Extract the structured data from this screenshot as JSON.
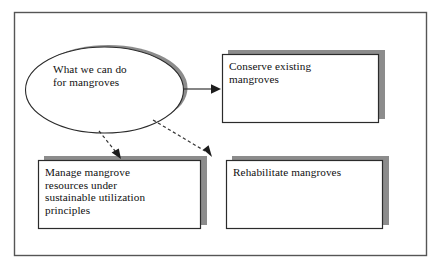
{
  "diagram": {
    "type": "flowchart",
    "title": "What we can do for mangroves",
    "frame": {
      "border_color": "#555555",
      "background": "#ffffff"
    },
    "palette": {
      "shape_fill": "#ffffff",
      "shape_stroke": "#2b2b2b",
      "shadow_color": "#8c8c8c",
      "arrow_color": "#333333",
      "text_color": "#101010"
    },
    "nodes": [
      {
        "id": "root",
        "shape": "ellipse",
        "label": "What we can do\nfor mangroves",
        "x": 26,
        "y": 47,
        "width": 157,
        "height": 86
      },
      {
        "id": "conserve",
        "shape": "rectangle",
        "label": "Conserve existing\nmangroves",
        "x": 222,
        "y": 54,
        "width": 156,
        "height": 69
      },
      {
        "id": "manage",
        "shape": "rectangle",
        "label": "Manage mangrove\nresources under\nsustainable utilization\nprinciples",
        "x": 38,
        "y": 160,
        "width": 162,
        "height": 69
      },
      {
        "id": "rehabilitate",
        "shape": "rectangle",
        "label": "Rehabilitate mangroves",
        "x": 226,
        "y": 160,
        "width": 156,
        "height": 69
      }
    ],
    "edges": [
      {
        "id": "root-to-conserve",
        "from": "root",
        "to": "conserve",
        "style": "solid",
        "arrowhead": "filled-triangle"
      },
      {
        "id": "root-to-manage",
        "from": "root",
        "to": "manage",
        "style": "dashed",
        "arrowhead": "filled-triangle"
      },
      {
        "id": "root-to-rehabilitate",
        "from": "root",
        "to": "rehabilitate",
        "style": "dashed",
        "arrowhead": "filled-triangle"
      }
    ]
  }
}
